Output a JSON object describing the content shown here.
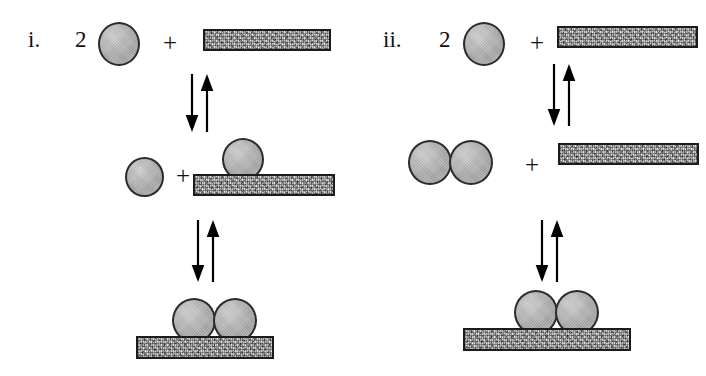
{
  "figure": {
    "background_color": "#ffffff",
    "particle_color": "#a9a9a9",
    "particle_outline_color": "#2b2b2b",
    "slab_color": "#b4b4b4",
    "slab_outline_color": "#1c1c1c",
    "arrow_color": "#000000"
  },
  "panels": [
    {
      "id": "panel-i",
      "label": "i.",
      "description": "Sequential adsorption: two free particles adsorb one at a time onto the surface, then combine.",
      "rows": [
        {
          "id": "panel-i-row-1",
          "name": "reactants",
          "coefficient": "2",
          "operator": "+",
          "species": [
            "particle",
            "surface-slab"
          ]
        },
        {
          "id": "panel-i-row-2",
          "name": "intermediate",
          "operator": "+",
          "species": [
            "free-particle",
            "surface-slab-with-one-adsorbed-particle"
          ]
        },
        {
          "id": "panel-i-row-3",
          "name": "product",
          "species": [
            "surface-slab-with-adsorbed-dimer"
          ]
        }
      ],
      "equilibria": [
        {
          "id": "panel-i-eq-1",
          "type": "reversible",
          "between": [
            "reactants",
            "intermediate"
          ]
        },
        {
          "id": "panel-i-eq-2",
          "type": "reversible",
          "between": [
            "intermediate",
            "product"
          ]
        }
      ]
    },
    {
      "id": "panel-ii",
      "label": "ii.",
      "description": "Pre-association pathway: two free particles first form a dimer in solution, which then adsorbs onto the surface.",
      "rows": [
        {
          "id": "panel-ii-row-1",
          "name": "reactants",
          "coefficient": "2",
          "operator": "+",
          "species": [
            "particle",
            "surface-slab"
          ]
        },
        {
          "id": "panel-ii-row-2",
          "name": "intermediate",
          "operator": "+",
          "species": [
            "free-dimer",
            "surface-slab"
          ]
        },
        {
          "id": "panel-ii-row-3",
          "name": "product",
          "species": [
            "surface-slab-with-adsorbed-dimer"
          ]
        }
      ],
      "equilibria": [
        {
          "id": "panel-ii-eq-1",
          "type": "reversible",
          "between": [
            "reactants",
            "intermediate"
          ]
        },
        {
          "id": "panel-ii-eq-2",
          "type": "reversible",
          "between": [
            "intermediate",
            "product"
          ]
        }
      ]
    }
  ]
}
